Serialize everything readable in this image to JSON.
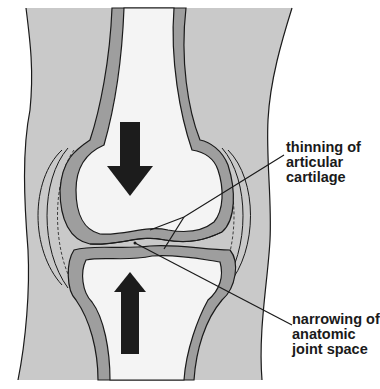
{
  "diagram": {
    "colors": {
      "soft_tissue": "#c9c9c9",
      "cartilage": "#9e9e9e",
      "bone_marrow": "#f4f4f4",
      "outline": "#1a1a1a",
      "arrow": "#1c1c1c",
      "background": "#ffffff"
    },
    "arrows": [
      {
        "name": "compression-arrow-down",
        "direction": "down"
      },
      {
        "name": "compression-arrow-up",
        "direction": "up"
      }
    ],
    "annotations": [
      {
        "id": "thinning",
        "lines": [
          "thinning of",
          "articular",
          "cartilage"
        ]
      },
      {
        "id": "narrowing",
        "lines": [
          "narrowing of",
          "anatomic",
          "joint space"
        ]
      }
    ]
  }
}
